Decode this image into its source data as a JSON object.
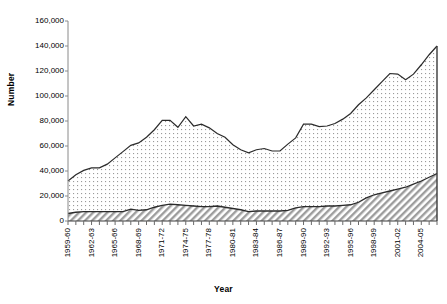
{
  "chart_data": {
    "type": "area",
    "title": "",
    "xlabel": "Year",
    "ylabel": "Number",
    "ylim": [
      0,
      160000
    ],
    "ytick_labels": [
      "160,000",
      "140,000",
      "120,000",
      "100,000",
      "80,000",
      "60,000",
      "40,000",
      "20,000",
      "0"
    ],
    "ytick_values": [
      160000,
      140000,
      120000,
      100000,
      80000,
      60000,
      40000,
      20000,
      0
    ],
    "grid": false,
    "legend": "none",
    "stacked": true,
    "x": [
      "1959-60",
      "1960-61",
      "1961-62",
      "1962-63",
      "1963-64",
      "1964-65",
      "1965-66",
      "1966-67",
      "1967-68",
      "1968-69",
      "1969-70",
      "1970-71",
      "1971-72",
      "1972-73",
      "1973-74",
      "1974-75",
      "1975-76",
      "1976-77",
      "1977-78",
      "1978-79",
      "1979-80",
      "1980-81",
      "1981-82",
      "1982-83",
      "1983-84",
      "1984-85",
      "1985-86",
      "1986-87",
      "1987-88",
      "1988-89",
      "1989-90",
      "1990-91",
      "1991-92",
      "1992-93",
      "1993-94",
      "1994-95",
      "1995-96",
      "1996-97",
      "1997-98",
      "1998-99",
      "1999-00",
      "2000-01",
      "2001-02",
      "2002-03",
      "2003-04",
      "2004-05",
      "2005-06",
      "2006-07"
    ],
    "xtick_labels": [
      "1959-60",
      "1962-63",
      "1965-66",
      "1968-69",
      "1971-72",
      "1974-75",
      "1977-78",
      "1980-81",
      "1983-84",
      "1986-87",
      "1989-90",
      "1992-93",
      "1995-96",
      "1998-99",
      "2001-02",
      "2004-05"
    ],
    "xtick_interval": 3,
    "series": [
      {
        "name": "lower-series",
        "pattern": "diagonal-hatch",
        "values": [
          6000,
          7000,
          7500,
          7500,
          7500,
          7500,
          7500,
          7500,
          9500,
          8500,
          9000,
          11000,
          12500,
          13500,
          13000,
          12500,
          12000,
          11500,
          11500,
          12000,
          11000,
          10000,
          9000,
          7500,
          8000,
          8000,
          8000,
          8000,
          8500,
          10500,
          11500,
          11500,
          11500,
          12000,
          12000,
          12500,
          13000,
          15000,
          18500,
          21000,
          22500,
          24000,
          25500,
          27000,
          29500,
          32000,
          35000,
          38000
        ]
      },
      {
        "name": "upper-series",
        "pattern": "fine-dot",
        "values": [
          26000,
          30000,
          33000,
          35000,
          35000,
          38000,
          43000,
          48000,
          51000,
          54000,
          58000,
          62000,
          68000,
          67000,
          62000,
          71000,
          64000,
          66000,
          63000,
          58000,
          56000,
          51000,
          48000,
          47000,
          49000,
          50000,
          48000,
          48000,
          53000,
          56000,
          66000,
          66000,
          64000,
          64000,
          66000,
          69000,
          73000,
          78000,
          80000,
          84000,
          89000,
          94000,
          92000,
          86000,
          88000,
          93000,
          98000,
          102000
        ]
      }
    ],
    "totals": [
      32000,
      37000,
      40500,
      42500,
      42500,
      45500,
      50500,
      55500,
      60500,
      62500,
      67000,
      73000,
      80500,
      80500,
      75000,
      83500,
      76000,
      77500,
      74500,
      70000,
      67000,
      61000,
      57000,
      54500,
      57000,
      58000,
      56000,
      56000,
      61500,
      66500,
      77500,
      77500,
      75500,
      76000,
      78000,
      81500,
      86000,
      93000,
      98500,
      105000,
      111500,
      118000,
      117500,
      113000,
      117500,
      125000,
      133000,
      140000
    ]
  }
}
